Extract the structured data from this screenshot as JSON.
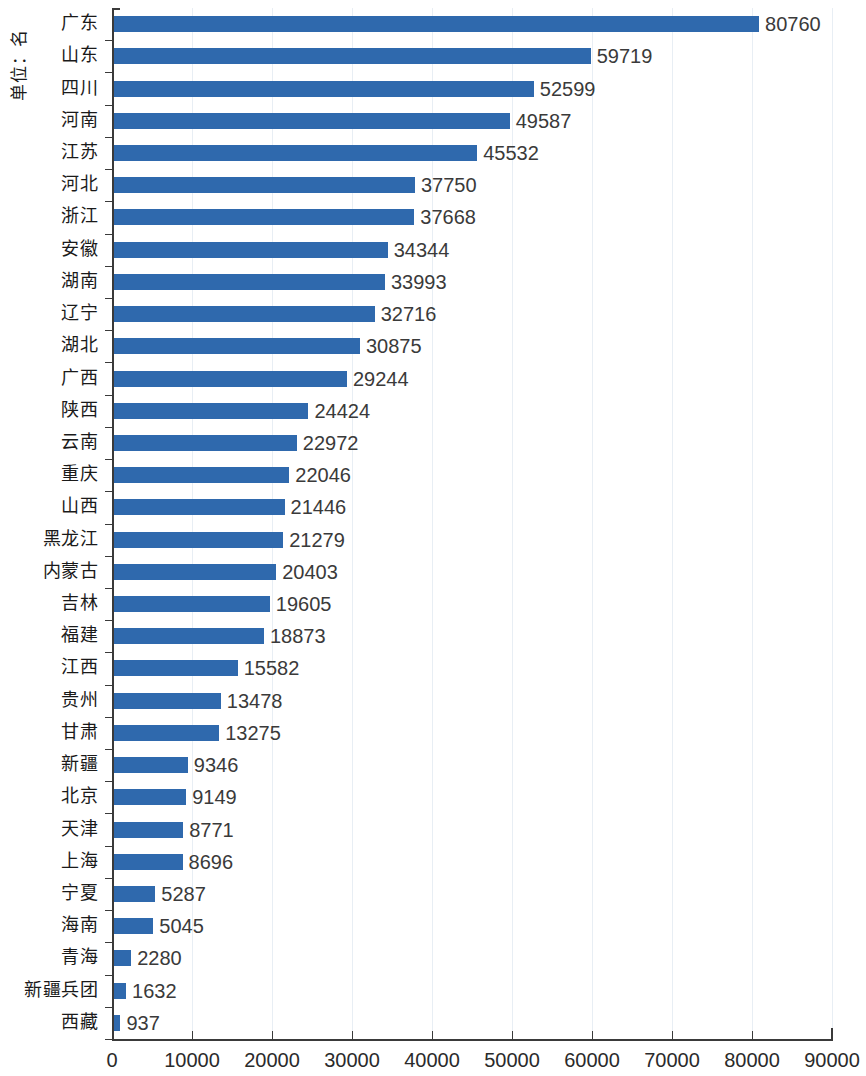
{
  "chart_data": {
    "type": "bar",
    "orientation": "horizontal",
    "title": "",
    "subtitle": "",
    "xlabel": "",
    "ylabel": "单位：名",
    "unit_label": "单位：名",
    "xlim": [
      0,
      90000
    ],
    "xticks": [
      0,
      10000,
      20000,
      30000,
      40000,
      50000,
      60000,
      70000,
      80000,
      90000
    ],
    "xtick_labels": [
      "0",
      "10000",
      "20000",
      "30000",
      "40000",
      "50000",
      "60000",
      "70000",
      "80000",
      "90000"
    ],
    "grid": true,
    "grid_axis": "x",
    "legend": null,
    "bar_color": "#2f69ad",
    "value_label_color": "#3a3a3a",
    "categories": [
      "广东",
      "山东",
      "四川",
      "河南",
      "江苏",
      "河北",
      "浙江",
      "安徽",
      "湖南",
      "辽宁",
      "湖北",
      "广西",
      "陕西",
      "云南",
      "重庆",
      "山西",
      "黑龙江",
      "内蒙古",
      "吉林",
      "福建",
      "江西",
      "贵州",
      "甘肃",
      "新疆",
      "北京",
      "天津",
      "上海",
      "宁夏",
      "海南",
      "青海",
      "新疆兵团",
      "西藏"
    ],
    "values": [
      80760,
      59719,
      52599,
      49587,
      45532,
      37750,
      37668,
      34344,
      33993,
      32716,
      30875,
      29244,
      24424,
      22972,
      22046,
      21446,
      21279,
      20403,
      19605,
      18873,
      15582,
      13478,
      13275,
      9346,
      9149,
      8771,
      8696,
      5287,
      5045,
      2280,
      1632,
      937
    ],
    "value_labels": [
      "80760",
      "59719",
      "52599",
      "49587",
      "45532",
      "37750",
      "37668",
      "34344",
      "33993",
      "32716",
      "30875",
      "29244",
      "24424",
      "22972",
      "22046",
      "21446",
      "21279",
      "20403",
      "19605",
      "18873",
      "15582",
      "13478",
      "13275",
      "9346",
      "9149",
      "8771",
      "8696",
      "5287",
      "5045",
      "2280",
      "1632",
      "937"
    ]
  }
}
